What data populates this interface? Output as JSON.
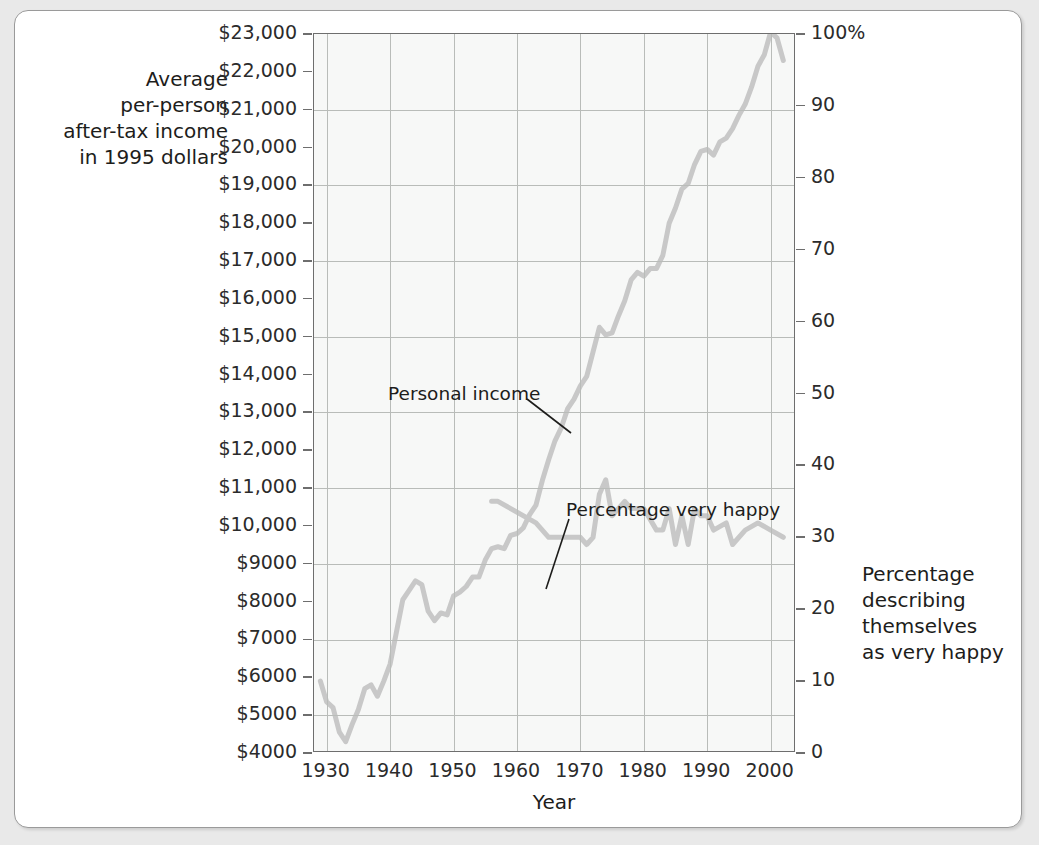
{
  "figure": {
    "axis_title_left_lines": [
      "Average",
      "per-person",
      "after-tax income",
      "in 1995 dollars"
    ],
    "axis_title_right_lines": [
      "Percentage",
      "describing",
      "themselves",
      "as very happy"
    ],
    "xlabel": "Year"
  },
  "annotations": {
    "income": "Personal income",
    "happy": "Percentage very happy"
  },
  "colors": {
    "income_line": "#c8c8c8",
    "happy_line": "#c8c8c8",
    "grid": "#b9bcb9",
    "plot_bg": "#f7f8f7",
    "axis": "#6e6e6e",
    "text": "#1d1d1b",
    "page_bg": "#e9e9e9",
    "frame_border": "#9a9a9a"
  },
  "chart_data": {
    "type": "line",
    "title": "",
    "subtitle": "",
    "xlabel": "Year",
    "ylabel": "Average per-person after-tax income in 1995 dollars",
    "y2label": "Percentage describing themselves as very happy",
    "grid": true,
    "legend": "annotations-on-plot",
    "xlim": [
      1928,
      2004
    ],
    "ylim": [
      4000,
      23000
    ],
    "y2lim": [
      0,
      100
    ],
    "xticks": [
      1930,
      1940,
      1950,
      1960,
      1970,
      1980,
      1990,
      2000
    ],
    "xtick_labels": [
      "1930",
      "1940",
      "1950",
      "1960",
      "1970",
      "1980",
      "1990",
      "2000"
    ],
    "yticks": [
      23000,
      22000,
      21000,
      20000,
      19000,
      18000,
      17000,
      16000,
      15000,
      14000,
      13000,
      12000,
      11000,
      10000,
      9000,
      8000,
      7000,
      6000,
      5000,
      4000
    ],
    "ytick_labels": [
      "$23,000",
      "$22,000",
      "$21,000",
      "$20,000",
      "$19,000",
      "$18,000",
      "$17,000",
      "$16,000",
      "$15,000",
      "$14,000",
      "$13,000",
      "$12,000",
      "$11,000",
      "$10,000",
      "$9000",
      "$8000",
      "$7000",
      "$6000",
      "$5000",
      "$4000"
    ],
    "y2ticks": [
      100,
      90,
      80,
      70,
      60,
      50,
      40,
      30,
      20,
      10,
      0
    ],
    "y2tick_labels": [
      "100%",
      "90",
      "80",
      "70",
      "60",
      "50",
      "40",
      "30",
      "20",
      "10",
      "0"
    ],
    "series": [
      {
        "name": "Personal income",
        "axis": "left",
        "units": "1995 dollars",
        "x": [
          1929,
          1930,
          1931,
          1932,
          1933,
          1934,
          1935,
          1936,
          1937,
          1938,
          1939,
          1940,
          1941,
          1942,
          1943,
          1944,
          1945,
          1946,
          1947,
          1948,
          1949,
          1950,
          1951,
          1952,
          1953,
          1954,
          1955,
          1956,
          1957,
          1958,
          1959,
          1960,
          1961,
          1962,
          1963,
          1964,
          1965,
          1966,
          1967,
          1968,
          1969,
          1970,
          1971,
          1972,
          1973,
          1974,
          1975,
          1976,
          1977,
          1978,
          1979,
          1980,
          1981,
          1982,
          1983,
          1984,
          1985,
          1986,
          1987,
          1988,
          1989,
          1990,
          1991,
          1992,
          1993,
          1994,
          1995,
          1996,
          1997,
          1998,
          1999,
          2000,
          2001,
          2002
        ],
        "y": [
          5900,
          5350,
          5200,
          4550,
          4300,
          4750,
          5150,
          5700,
          5800,
          5500,
          5900,
          6350,
          7200,
          8050,
          8300,
          8550,
          8450,
          7750,
          7500,
          7700,
          7650,
          8150,
          8250,
          8400,
          8650,
          8650,
          9100,
          9400,
          9450,
          9400,
          9750,
          9800,
          9950,
          10300,
          10550,
          11200,
          11750,
          12250,
          12600,
          13100,
          13350,
          13700,
          13950,
          14600,
          15250,
          15050,
          15100,
          15550,
          15950,
          16500,
          16700,
          16600,
          16800,
          16800,
          17150,
          18000,
          18400,
          18900,
          19050,
          19550,
          19900,
          19950,
          19800,
          20150,
          20250,
          20500,
          20850,
          21150,
          21600,
          22150,
          22450,
          23050,
          22900,
          22300
        ]
      },
      {
        "name": "Percentage very happy",
        "axis": "right",
        "units": "percent",
        "x": [
          1956,
          1957,
          1963,
          1965,
          1966,
          1970,
          1971,
          1972,
          1973,
          1974,
          1975,
          1976,
          1977,
          1978,
          1980,
          1982,
          1983,
          1984,
          1985,
          1986,
          1987,
          1988,
          1989,
          1990,
          1991,
          1993,
          1994,
          1996,
          1998,
          2000,
          2002
        ],
        "y": [
          35,
          35,
          32,
          30,
          30,
          30,
          29,
          30,
          36,
          38,
          33,
          34,
          35,
          34,
          34,
          31,
          31,
          34,
          29,
          33,
          29,
          34,
          33,
          33,
          31,
          32,
          29,
          31,
          32,
          31,
          30
        ]
      }
    ]
  }
}
